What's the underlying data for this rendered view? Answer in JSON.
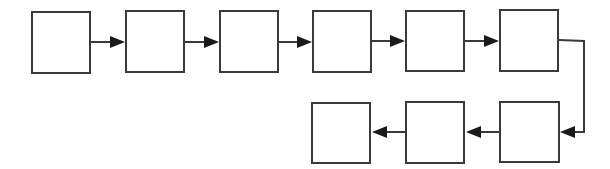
{
  "diagram": {
    "type": "flowchart",
    "colors": {
      "stroke": "#3a3a3a",
      "arrowhead": "#1a1a1a",
      "background": "#ffffff"
    },
    "nodes": [
      {
        "id": "n1",
        "label": "",
        "x": 31,
        "y": 11,
        "w": 60,
        "h": 63
      },
      {
        "id": "n2",
        "label": "",
        "x": 125,
        "y": 10,
        "w": 60,
        "h": 63
      },
      {
        "id": "n3",
        "label": "",
        "x": 219,
        "y": 10,
        "w": 60,
        "h": 63
      },
      {
        "id": "n4",
        "label": "",
        "x": 312,
        "y": 10,
        "w": 60,
        "h": 63
      },
      {
        "id": "n5",
        "label": "",
        "x": 405,
        "y": 10,
        "w": 60,
        "h": 62
      },
      {
        "id": "n6",
        "label": "",
        "x": 499,
        "y": 9,
        "w": 60,
        "h": 63
      },
      {
        "id": "n7",
        "label": "",
        "x": 499,
        "y": 101,
        "w": 61,
        "h": 62
      },
      {
        "id": "n8",
        "label": "",
        "x": 405,
        "y": 101,
        "w": 60,
        "h": 63
      },
      {
        "id": "n9",
        "label": "",
        "x": 311,
        "y": 102,
        "w": 60,
        "h": 62
      }
    ],
    "edges": [
      {
        "from": "n1",
        "to": "n2",
        "direction": "right"
      },
      {
        "from": "n2",
        "to": "n3",
        "direction": "right"
      },
      {
        "from": "n3",
        "to": "n4",
        "direction": "right"
      },
      {
        "from": "n4",
        "to": "n5",
        "direction": "right"
      },
      {
        "from": "n5",
        "to": "n6",
        "direction": "right"
      },
      {
        "from": "n6",
        "to": "n7",
        "direction": "right-down-left"
      },
      {
        "from": "n7",
        "to": "n8",
        "direction": "left"
      },
      {
        "from": "n8",
        "to": "n9",
        "direction": "left"
      }
    ]
  }
}
